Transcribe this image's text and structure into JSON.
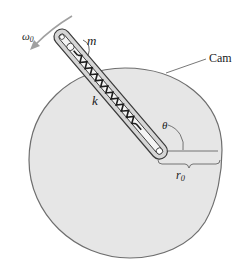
{
  "diagram": {
    "colors": {
      "cam_fill": "#e6e6e6",
      "cam_edge": "#6e6e6e",
      "slot_fill": "#d2d2d2",
      "slot_edge": "#444444",
      "spring": "#1e1e1e",
      "arrow": "#9a9a9a"
    },
    "labels": {
      "omega": "ω",
      "omega_sub": "0",
      "mass": "m",
      "spring": "k",
      "cam": "Cam",
      "angle": "θ",
      "radius": "r",
      "radius_sub": "0"
    },
    "elements": [
      {
        "id": "cam",
        "type": "disk"
      },
      {
        "id": "slot",
        "type": "guide"
      },
      {
        "id": "spring",
        "type": "spring",
        "label": "k"
      },
      {
        "id": "mass",
        "type": "mass",
        "label": "m"
      },
      {
        "id": "rotation-arrow",
        "type": "arrow",
        "label": "ω0"
      },
      {
        "id": "angle-arc",
        "type": "angle",
        "label": "θ"
      },
      {
        "id": "radius-dimension",
        "type": "dimension",
        "label": "r0"
      }
    ]
  }
}
